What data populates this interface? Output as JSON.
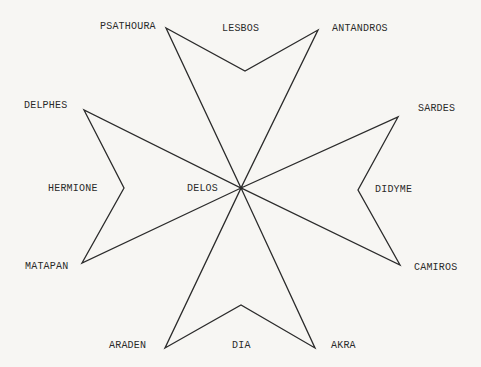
{
  "diagram": {
    "stroke_color": "#2b2b2b",
    "background": "#f7f6f3",
    "center": {
      "x": 241,
      "y": 188
    },
    "cross_points": [
      [
        241,
        188
      ],
      [
        166,
        28
      ],
      [
        245,
        71
      ],
      [
        318,
        30
      ],
      [
        241,
        188
      ],
      [
        398,
        117
      ],
      [
        358,
        190
      ],
      [
        400,
        265
      ],
      [
        241,
        188
      ],
      [
        315,
        348
      ],
      [
        241,
        305
      ],
      [
        165,
        348
      ],
      [
        241,
        188
      ],
      [
        82,
        263
      ],
      [
        124,
        188
      ],
      [
        84,
        110
      ]
    ],
    "labels": [
      {
        "id": "psathoura",
        "text": "PSATHOURA",
        "x": 100,
        "y": 22
      },
      {
        "id": "lesbos",
        "text": "LESBOS",
        "x": 222,
        "y": 24
      },
      {
        "id": "antandros",
        "text": "ANTANDROS",
        "x": 332,
        "y": 24
      },
      {
        "id": "delphes",
        "text": "DELPHES",
        "x": 24,
        "y": 101
      },
      {
        "id": "sardes",
        "text": "SARDES",
        "x": 418,
        "y": 104
      },
      {
        "id": "hermione",
        "text": "HERMIONE",
        "x": 48,
        "y": 184
      },
      {
        "id": "delos",
        "text": "DELOS",
        "x": 187,
        "y": 184
      },
      {
        "id": "didyme",
        "text": "DIDYME",
        "x": 375,
        "y": 185
      },
      {
        "id": "matapan",
        "text": "MATAPAN",
        "x": 25,
        "y": 262
      },
      {
        "id": "camiros",
        "text": "CAMIROS",
        "x": 414,
        "y": 263
      },
      {
        "id": "araden",
        "text": "ARADEN",
        "x": 109,
        "y": 341
      },
      {
        "id": "dia",
        "text": "DIA",
        "x": 232,
        "y": 341
      },
      {
        "id": "akra",
        "text": "AKRA",
        "x": 331,
        "y": 341
      }
    ]
  }
}
